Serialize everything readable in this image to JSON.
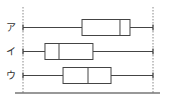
{
  "chart_data": {
    "type": "boxplot",
    "title": "",
    "xlabel": "",
    "ylabel": "",
    "orientation": "horizontal",
    "grid": false,
    "xlim": [
      0,
      100
    ],
    "reference_lines": {
      "min_dotted": 0,
      "max_dotted": 100
    },
    "categories": [
      "ア",
      "イ",
      "ウ"
    ],
    "series": [
      {
        "name": "ア",
        "min": 0,
        "q1": 45.4,
        "median": 74.6,
        "q3": 82.3,
        "max": 100
      },
      {
        "name": "イ",
        "min": 0,
        "q1": 16.9,
        "median": 27.7,
        "q3": 53.8,
        "max": 100
      },
      {
        "name": "ウ",
        "min": 0,
        "q1": 30.8,
        "median": 50.0,
        "q3": 67.7,
        "max": 100
      }
    ],
    "colors": {
      "stroke": "#444444",
      "dotted": "#888888",
      "axis": "#333333",
      "fill": "#ffffff"
    }
  }
}
